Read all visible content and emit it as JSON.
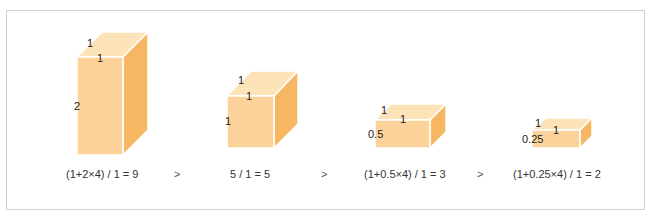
{
  "colors": {
    "top_face": "#fde3b8",
    "front_face": "#fdd29a",
    "side_face": "#f7b661",
    "edge": "#ffffff",
    "frame_border": "#cfcfcf"
  },
  "boxes": [
    {
      "id": "box-1",
      "dimensions": {
        "length": "1",
        "width": "1",
        "height": "2"
      },
      "labels": {
        "top_depth": "1",
        "top_width": "1",
        "height": "2"
      },
      "formula": "(1+2×4) / 1 = 9"
    },
    {
      "id": "box-2",
      "dimensions": {
        "length": "1",
        "width": "1",
        "height": "1"
      },
      "labels": {
        "top_depth": "1",
        "top_width": "1",
        "height": "1"
      },
      "formula": "5 / 1 = 5"
    },
    {
      "id": "box-3",
      "dimensions": {
        "length": "1",
        "width": "1",
        "height": "0.5"
      },
      "labels": {
        "top_depth": "1",
        "top_width": "1",
        "height": "0.5"
      },
      "formula": "(1+0.5×4) / 1 = 3"
    },
    {
      "id": "box-4",
      "dimensions": {
        "length": "1",
        "width": "1",
        "height": "0.25"
      },
      "labels": {
        "top_depth": "1",
        "top_width": "1",
        "height": "0.25"
      },
      "formula": "(1+0.25×4) / 1 = 2"
    }
  ],
  "comparators": [
    ">",
    ">",
    ">"
  ]
}
